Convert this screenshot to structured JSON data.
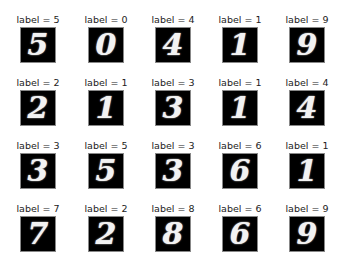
{
  "chart_data": {
    "type": "image_grid",
    "title": "",
    "rows": 4,
    "cols": 5,
    "panels": [
      {
        "title": "label = 5",
        "label": 5
      },
      {
        "title": "label = 0",
        "label": 0
      },
      {
        "title": "label = 4",
        "label": 4
      },
      {
        "title": "label = 1",
        "label": 1
      },
      {
        "title": "label = 9",
        "label": 9
      },
      {
        "title": "label = 2",
        "label": 2
      },
      {
        "title": "label = 1",
        "label": 1
      },
      {
        "title": "label = 3",
        "label": 3
      },
      {
        "title": "label = 1",
        "label": 1
      },
      {
        "title": "label = 4",
        "label": 4
      },
      {
        "title": "label = 3",
        "label": 3
      },
      {
        "title": "label = 5",
        "label": 5
      },
      {
        "title": "label = 3",
        "label": 3
      },
      {
        "title": "label = 6",
        "label": 6
      },
      {
        "title": "label = 1",
        "label": 1
      },
      {
        "title": "label = 7",
        "label": 7
      },
      {
        "title": "label = 2",
        "label": 2
      },
      {
        "title": "label = 8",
        "label": 8
      },
      {
        "title": "label = 6",
        "label": 6
      },
      {
        "title": "label = 9",
        "label": 9
      }
    ],
    "axes": "off",
    "colormap": "gray"
  }
}
